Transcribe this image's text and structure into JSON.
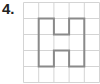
{
  "problem": {
    "label": "4."
  },
  "grid": {
    "columns": 5,
    "rows": 5,
    "cell_width": 15.2,
    "cell_height": 16,
    "line_color": "#d4d4d4",
    "shape_color": "#8a8a8a",
    "shape_vertices": [
      [
        1,
        1
      ],
      [
        2,
        1
      ],
      [
        2,
        2
      ],
      [
        3,
        2
      ],
      [
        3,
        1
      ],
      [
        4,
        1
      ],
      [
        4,
        4
      ],
      [
        3,
        4
      ],
      [
        3,
        3
      ],
      [
        2,
        3
      ],
      [
        2,
        4
      ],
      [
        1,
        4
      ]
    ]
  }
}
